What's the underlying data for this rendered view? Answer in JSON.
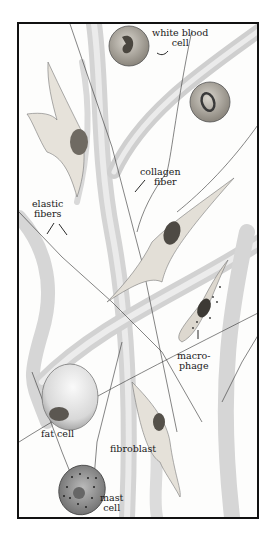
{
  "figure": {
    "labels": {
      "white_blood_cell": [
        "white blood",
        "cell"
      ],
      "collagen_fiber": [
        "collagen",
        "fiber"
      ],
      "elastic_fibers": [
        "elastic",
        "fibers"
      ],
      "macrophage": [
        "macro-",
        "phage"
      ],
      "fat_cell": [
        "fat cell"
      ],
      "fibroblast": [
        "fibroblast"
      ],
      "mast_cell": [
        "mast",
        "cell"
      ]
    }
  }
}
